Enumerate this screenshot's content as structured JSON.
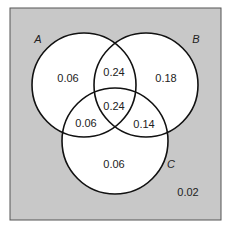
{
  "diagram": {
    "type": "venn",
    "colors": {
      "universe_fill": "#c8c8c8",
      "universe_stroke": "#555555",
      "circle_fill": "#ffffff",
      "circle_stroke": "#111111",
      "text": "#222222"
    },
    "sets": [
      {
        "name": "A",
        "label": "A"
      },
      {
        "name": "B",
        "label": "B"
      },
      {
        "name": "C",
        "label": "C"
      }
    ],
    "regions": {
      "a_only": "0.06",
      "b_only": "0.18",
      "c_only": "0.06",
      "a_and_b_only": "0.24",
      "a_and_c_only": "0.06",
      "b_and_c_only": "0.14",
      "a_and_b_and_c": "0.24",
      "outside": "0.02"
    }
  }
}
